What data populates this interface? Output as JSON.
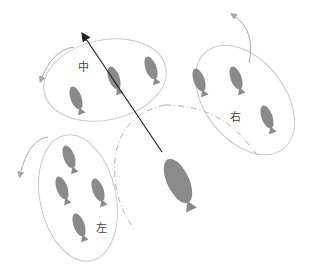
{
  "diagram": {
    "type": "fish-school-formation",
    "groups": [
      {
        "id": "middle",
        "label": "中",
        "fish_count": 3
      },
      {
        "id": "right",
        "label": "右",
        "fish_count": 3
      },
      {
        "id": "left",
        "label": "左",
        "fish_count": 4
      }
    ],
    "leader": {
      "label": "",
      "fish_count": 1
    },
    "arrows": {
      "direction_arrow": "heading of leader fish",
      "turn_arrows": 3
    },
    "colors": {
      "fish": "#8a8a8a",
      "group_outline": "#c8c8c8",
      "turn_arrow": "#a8a8a8",
      "direction_arrow": "#222222",
      "dashdot_path": "#b0b0b0",
      "background": "#ffffff",
      "label_text": "#444444"
    }
  }
}
